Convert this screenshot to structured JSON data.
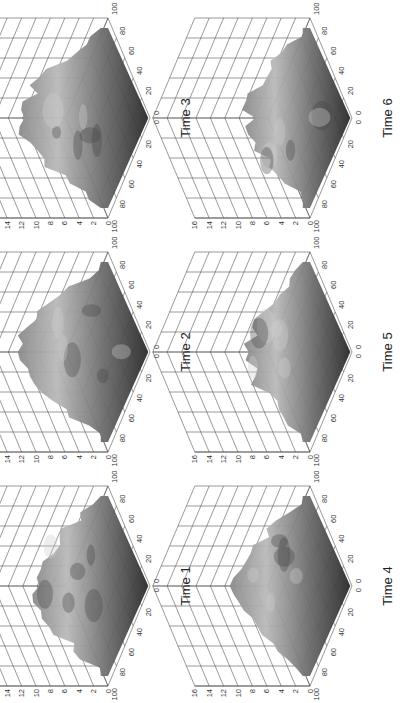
{
  "figure": {
    "orientation": "rotated-90-ccw",
    "panels": [
      {
        "label": "Time 1"
      },
      {
        "label": "Time 2"
      },
      {
        "label": "Time 3"
      },
      {
        "label": "Time 4"
      },
      {
        "label": "Time 5"
      },
      {
        "label": "Time 6"
      }
    ]
  },
  "axes": {
    "z_ticks": [
      "0",
      "2",
      "4",
      "6",
      "8",
      "10",
      "12",
      "14",
      "16"
    ],
    "x_ticks": [
      "100",
      "80",
      "60",
      "40",
      "20",
      "0"
    ],
    "y_ticks": [
      "0",
      "20",
      "40",
      "60",
      "80",
      "100"
    ]
  },
  "chart_data": {
    "type": "heatmap",
    "subtype": "3d-surface",
    "title": "",
    "panels": [
      "Time 1",
      "Time 2",
      "Time 3",
      "Time 4",
      "Time 5",
      "Time 6"
    ],
    "layout": {
      "rows": 2,
      "cols": 3,
      "order": [
        [
          "Time 1",
          "Time 2",
          "Time 3"
        ],
        [
          "Time 4",
          "Time 5",
          "Time 6"
        ]
      ]
    },
    "xlabel": "",
    "ylabel": "",
    "zlabel": "",
    "x_range": [
      0,
      100
    ],
    "y_range": [
      0,
      100
    ],
    "zlim": [
      0,
      16
    ],
    "x_ticks": [
      0,
      20,
      40,
      60,
      80,
      100
    ],
    "y_ticks": [
      0,
      20,
      40,
      60,
      80,
      100
    ],
    "z_ticks": [
      0,
      2,
      4,
      6,
      8,
      10,
      12,
      14,
      16
    ],
    "grid": true,
    "colormap": "grayscale",
    "approx_peak_height": {
      "Time 1": 12,
      "Time 2": 14,
      "Time 3": 14,
      "Time 4": 12,
      "Time 5": 10,
      "Time 6": 10
    }
  }
}
